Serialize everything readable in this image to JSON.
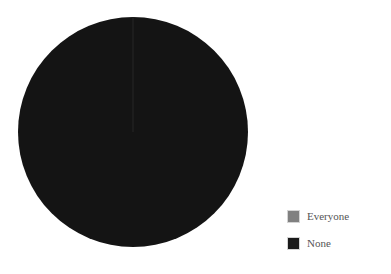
{
  "figure": {
    "background_color": "#ffffff",
    "width": 391,
    "height": 274
  },
  "chart_data": {
    "type": "pie",
    "title": "",
    "xlabel": "",
    "ylabel": "",
    "categories": [
      "Everyone",
      "None"
    ],
    "values": [
      0,
      100
    ],
    "slices": [
      {
        "label": "Everyone",
        "value": 0,
        "percent": 0,
        "color": "#808080",
        "start_angle_deg": 0,
        "end_angle_deg": 0
      },
      {
        "label": "None",
        "value": 100,
        "percent": 100,
        "color": "#141414",
        "start_angle_deg": 0,
        "end_angle_deg": 360
      }
    ],
    "legend": {
      "position": "right",
      "entries": [
        {
          "label": "Everyone",
          "color": "#808080"
        },
        {
          "label": "None",
          "color": "#1a1a1a"
        }
      ]
    },
    "geometry": {
      "center_x": 133,
      "center_y": 132,
      "radius": 115,
      "start_angle_deg": 90,
      "direction": "clockwise"
    },
    "grid": false,
    "axes_visible": false
  }
}
